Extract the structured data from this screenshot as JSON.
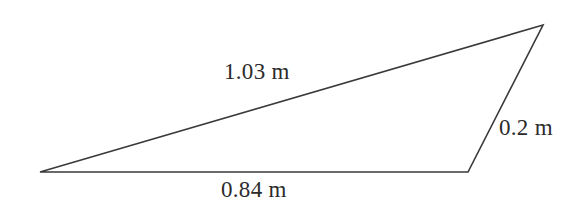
{
  "figure": {
    "type": "triangle-diagram",
    "background_color": "#ffffff",
    "stroke_color": "#3a3a3a",
    "text_color": "#2b2b2b",
    "width": 582,
    "height": 207,
    "vertices": {
      "left": {
        "x": 40,
        "y": 172
      },
      "apex": {
        "x": 543,
        "y": 25
      },
      "bottom_right": {
        "x": 468,
        "y": 172
      }
    },
    "labels": {
      "hypotenuse": "1.03 m",
      "base": "0.84 m",
      "right_side": "0.2 m"
    }
  },
  "chart_data": {
    "type": "diagram",
    "shape": "triangle",
    "title": "",
    "unit": "m",
    "sides": [
      {
        "name": "hypotenuse",
        "label": "1.03 m",
        "value": 1.03,
        "from": "left",
        "to": "apex"
      },
      {
        "name": "base",
        "label": "0.84 m",
        "value": 0.84,
        "from": "left",
        "to": "bottom_right"
      },
      {
        "name": "right-side",
        "label": "0.2 m",
        "value": 0.2,
        "from": "bottom_right",
        "to": "apex"
      }
    ]
  }
}
